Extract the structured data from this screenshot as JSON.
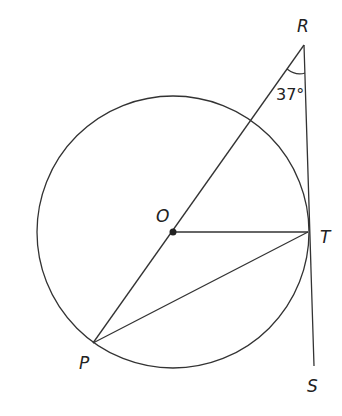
{
  "diagram": {
    "points": {
      "R": {
        "label": "R",
        "x": 304,
        "y": 45
      },
      "O": {
        "label": "O",
        "x": 173,
        "y": 232
      },
      "T": {
        "label": "T",
        "x": 308,
        "y": 232
      },
      "P": {
        "label": "P",
        "x": 93,
        "y": 343
      },
      "S": {
        "label": "S",
        "x": 314,
        "y": 366
      }
    },
    "circle": {
      "center": "O",
      "radius": 136
    },
    "segments": [
      "R-P (through O)",
      "O-T",
      "P-T",
      "R-S (tangent at T)"
    ],
    "angle": {
      "vertex": "R",
      "value": "37°"
    }
  }
}
